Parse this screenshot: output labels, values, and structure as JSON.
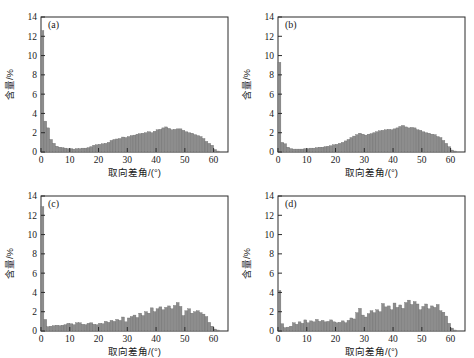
{
  "figure": {
    "background_color": "#ffffff",
    "bar_color": "#8d8d8d",
    "bar_edge_color": "#6a6a6a",
    "axis_color": "#2b2b2b",
    "panel_count": 4
  },
  "chart_data": [
    {
      "type": "bar",
      "panel_label": "(a)",
      "title": "",
      "xlabel": "取向差角/(°)",
      "ylabel": "含量/%",
      "xlim": [
        0,
        65
      ],
      "ylim": [
        0,
        14
      ],
      "xticks": [
        0,
        10,
        20,
        30,
        40,
        50,
        60
      ],
      "yticks": [
        0,
        2,
        4,
        6,
        8,
        10,
        12,
        14
      ],
      "grid": false,
      "bin_width": 1,
      "x": [
        1,
        2,
        3,
        4,
        5,
        6,
        7,
        8,
        9,
        10,
        11,
        12,
        13,
        14,
        15,
        16,
        17,
        18,
        19,
        20,
        21,
        22,
        23,
        24,
        25,
        26,
        27,
        28,
        29,
        30,
        31,
        32,
        33,
        34,
        35,
        36,
        37,
        38,
        39,
        40,
        41,
        42,
        43,
        44,
        45,
        46,
        47,
        48,
        49,
        50,
        51,
        52,
        53,
        54,
        55,
        56,
        57,
        58,
        59,
        60,
        61,
        62
      ],
      "values": [
        12.6,
        3.2,
        2.5,
        1.3,
        0.9,
        0.6,
        0.5,
        0.45,
        0.4,
        0.35,
        0.35,
        0.3,
        0.35,
        0.35,
        0.4,
        0.4,
        0.45,
        0.55,
        0.7,
        0.75,
        0.8,
        0.85,
        0.9,
        1.0,
        1.2,
        1.3,
        1.35,
        1.4,
        1.55,
        1.5,
        1.6,
        1.7,
        1.75,
        1.85,
        1.9,
        1.95,
        2.0,
        2.1,
        2.0,
        2.15,
        2.3,
        2.35,
        2.5,
        2.6,
        2.45,
        2.3,
        2.35,
        2.4,
        2.4,
        2.25,
        2.1,
        2.0,
        1.95,
        1.8,
        1.7,
        1.6,
        1.4,
        1.1,
        0.9,
        0.7,
        0.25,
        0.1
      ]
    },
    {
      "type": "bar",
      "panel_label": "(b)",
      "title": "",
      "xlabel": "取向差角/(°)",
      "ylabel": "含量/%",
      "xlim": [
        0,
        65
      ],
      "ylim": [
        0,
        14
      ],
      "xticks": [
        0,
        10,
        20,
        30,
        40,
        50,
        60
      ],
      "yticks": [
        0,
        2,
        4,
        6,
        8,
        10,
        12,
        14
      ],
      "grid": false,
      "bin_width": 1,
      "x": [
        1,
        2,
        3,
        4,
        5,
        6,
        7,
        8,
        9,
        10,
        11,
        12,
        13,
        14,
        15,
        16,
        17,
        18,
        19,
        20,
        21,
        22,
        23,
        24,
        25,
        26,
        27,
        28,
        29,
        30,
        31,
        32,
        33,
        34,
        35,
        36,
        37,
        38,
        39,
        40,
        41,
        42,
        43,
        44,
        45,
        46,
        47,
        48,
        49,
        50,
        51,
        52,
        53,
        54,
        55,
        56,
        57,
        58,
        59,
        60,
        61,
        62
      ],
      "values": [
        9.3,
        1.0,
        0.85,
        0.5,
        0.35,
        0.3,
        0.3,
        0.3,
        0.3,
        0.35,
        0.35,
        0.4,
        0.4,
        0.45,
        0.5,
        0.5,
        0.55,
        0.6,
        0.65,
        0.75,
        0.8,
        0.9,
        1.0,
        1.15,
        1.3,
        1.5,
        1.65,
        1.8,
        1.95,
        1.85,
        1.75,
        1.85,
        1.9,
        2.0,
        2.1,
        2.2,
        2.25,
        2.3,
        2.35,
        2.3,
        2.4,
        2.5,
        2.65,
        2.75,
        2.6,
        2.5,
        2.55,
        2.5,
        2.3,
        2.25,
        2.1,
        2.0,
        1.95,
        1.85,
        1.8,
        1.6,
        1.5,
        1.2,
        0.9,
        0.55,
        0.2,
        0.1
      ]
    },
    {
      "type": "bar",
      "panel_label": "(c)",
      "title": "",
      "xlabel": "取向差角/(°)",
      "ylabel": "含量/%",
      "xlim": [
        0,
        65
      ],
      "ylim": [
        0,
        14
      ],
      "xticks": [
        0,
        10,
        20,
        30,
        40,
        50,
        60
      ],
      "yticks": [
        0,
        2,
        4,
        6,
        8,
        10,
        12,
        14
      ],
      "grid": false,
      "bin_width": 1,
      "x": [
        1,
        2,
        3,
        4,
        5,
        6,
        7,
        8,
        9,
        10,
        11,
        12,
        13,
        14,
        15,
        16,
        17,
        18,
        19,
        20,
        21,
        22,
        23,
        24,
        25,
        26,
        27,
        28,
        29,
        30,
        31,
        32,
        33,
        34,
        35,
        36,
        37,
        38,
        39,
        40,
        41,
        42,
        43,
        44,
        45,
        46,
        47,
        48,
        49,
        50,
        51,
        52,
        53,
        54,
        55,
        56,
        57,
        58,
        59,
        60,
        61,
        62
      ],
      "values": [
        12.9,
        1.2,
        0.45,
        0.5,
        0.55,
        0.6,
        0.55,
        0.6,
        0.65,
        0.8,
        0.75,
        0.65,
        0.85,
        0.85,
        0.7,
        0.65,
        0.8,
        0.85,
        0.7,
        0.65,
        0.8,
        0.75,
        1.0,
        0.9,
        1.1,
        1.0,
        1.2,
        1.1,
        1.45,
        0.95,
        1.35,
        1.5,
        1.65,
        1.4,
        1.85,
        1.6,
        2.0,
        1.85,
        2.4,
        2.0,
        2.3,
        2.5,
        2.2,
        2.45,
        2.6,
        2.3,
        2.65,
        2.95,
        2.55,
        1.6,
        2.1,
        2.3,
        1.85,
        2.0,
        2.1,
        1.9,
        1.75,
        1.5,
        0.9,
        0.5,
        0.2,
        0.1
      ]
    },
    {
      "type": "bar",
      "panel_label": "(d)",
      "title": "",
      "xlabel": "取向差角/(°)",
      "ylabel": "含量/%",
      "xlim": [
        0,
        65
      ],
      "ylim": [
        0,
        14
      ],
      "xticks": [
        0,
        10,
        20,
        30,
        40,
        50,
        60
      ],
      "yticks": [
        0,
        2,
        4,
        6,
        8,
        10,
        12,
        14
      ],
      "grid": false,
      "bin_width": 1,
      "x": [
        1,
        2,
        3,
        4,
        5,
        6,
        7,
        8,
        9,
        10,
        11,
        12,
        13,
        14,
        15,
        16,
        17,
        18,
        19,
        20,
        21,
        22,
        23,
        24,
        25,
        26,
        27,
        28,
        29,
        30,
        31,
        32,
        33,
        34,
        35,
        36,
        37,
        38,
        39,
        40,
        41,
        42,
        43,
        44,
        45,
        46,
        47,
        48,
        49,
        50,
        51,
        52,
        53,
        54,
        55,
        56,
        57,
        58,
        59,
        60,
        61,
        62
      ],
      "values": [
        4.2,
        0.75,
        0.35,
        0.4,
        0.5,
        0.85,
        0.7,
        0.95,
        0.8,
        1.15,
        0.85,
        1.05,
        0.95,
        1.2,
        1.0,
        1.1,
        0.95,
        1.0,
        1.15,
        0.95,
        0.85,
        0.9,
        1.05,
        0.85,
        1.1,
        1.35,
        1.25,
        1.9,
        2.35,
        1.65,
        1.45,
        1.8,
        2.1,
        1.9,
        2.2,
        2.0,
        2.85,
        2.5,
        2.6,
        2.2,
        2.9,
        2.45,
        2.7,
        2.35,
        2.95,
        3.2,
        2.75,
        3.05,
        2.8,
        2.2,
        2.55,
        2.8,
        2.3,
        2.6,
        2.45,
        2.75,
        2.1,
        1.95,
        1.55,
        0.8,
        0.3,
        0.1
      ]
    }
  ]
}
